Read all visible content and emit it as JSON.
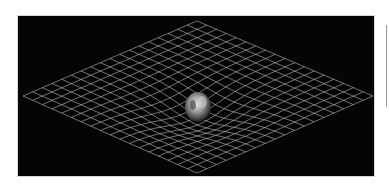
{
  "figure": {
    "object": "earth",
    "colors": {
      "background": "#050505",
      "grid_line": "#bdbdbd",
      "page": "#ffffff",
      "side_rule": "#9a9a9a"
    },
    "grid": {
      "top": [
        179,
        5
      ],
      "left": [
        5,
        80
      ],
      "right": [
        355,
        80
      ],
      "bottom": [
        179,
        157
      ],
      "lines_per_side": 18,
      "well_center": [
        180,
        93
      ],
      "well_depth": 12
    },
    "earth": {
      "cx": 180,
      "cy": 91,
      "rx": 13,
      "ry": 15
    }
  }
}
